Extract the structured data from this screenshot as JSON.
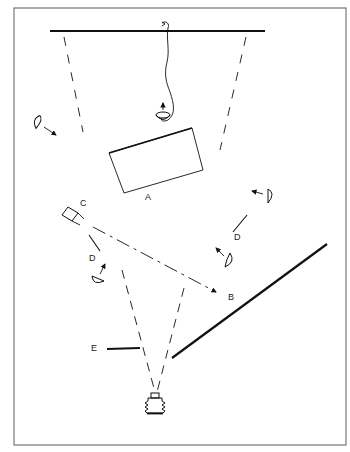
{
  "diagram": {
    "type": "lighting-setup-floor-plan",
    "labels": {
      "A": "A",
      "B": "B",
      "C": "C",
      "D_left": "D",
      "D_right": "D",
      "E": "E"
    },
    "elements": [
      {
        "id": "backdrop-wall",
        "desc": "thick line at top (background)"
      },
      {
        "id": "overhead-light",
        "desc": "hanging lamp with cable, arrow up"
      },
      {
        "id": "A",
        "desc": "rectangular subject / table"
      },
      {
        "id": "B",
        "desc": "direction of camera C axis"
      },
      {
        "id": "C",
        "desc": "secondary camera/light box"
      },
      {
        "id": "D",
        "desc": "reflector flags"
      },
      {
        "id": "E",
        "desc": "short flag/panel near camera"
      },
      {
        "id": "main-camera",
        "desc": "bellows camera at bottom"
      },
      {
        "id": "lights",
        "desc": "four umbrella/spot lights with direction arrows"
      }
    ],
    "colors": {
      "ink": "#111111",
      "frame": "#777777",
      "background": "#ffffff"
    }
  }
}
